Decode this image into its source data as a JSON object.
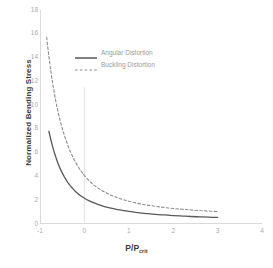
{
  "chart_data": {
    "type": "line",
    "title": "",
    "subtitle": "",
    "xlabel": "P/P",
    "xlabel_sub": "crit",
    "ylabel": "Normalized Bending  Stress",
    "xlim": [
      -1,
      4
    ],
    "ylim": [
      0,
      18
    ],
    "xticks": [
      "-1",
      "0",
      "1",
      "2",
      "3",
      "4"
    ],
    "xtick_values": [
      -1,
      0,
      1,
      2,
      3,
      4
    ],
    "yticks": [
      "0",
      "2",
      "4",
      "6",
      "8",
      "10",
      "12",
      "14",
      "16",
      "18"
    ],
    "ytick_values": [
      0,
      2,
      4,
      6,
      8,
      10,
      12,
      14,
      16,
      18
    ],
    "grid": false,
    "legend_position": "upper-center",
    "annotations": [
      {
        "name": "vertical-reference-line",
        "x": 0,
        "y_from": 0,
        "y_to": 11.5
      }
    ],
    "series": [
      {
        "name": "Angular Distortion",
        "style": "solid",
        "color": "#595959",
        "x": [
          -0.8,
          -0.75,
          -0.7,
          -0.65,
          -0.6,
          -0.55,
          -0.5,
          -0.45,
          -0.4,
          -0.35,
          -0.3,
          -0.25,
          -0.2,
          -0.15,
          -0.1,
          -0.05,
          0.0,
          0.1,
          0.2,
          0.3,
          0.4,
          0.5,
          0.6,
          0.7,
          0.8,
          0.9,
          1.0,
          1.2,
          1.4,
          1.6,
          1.8,
          2.0,
          2.2,
          2.4,
          2.6,
          2.8,
          3.0
        ],
        "y": [
          7.8,
          7.0,
          6.3,
          5.7,
          5.15,
          4.7,
          4.3,
          3.95,
          3.65,
          3.38,
          3.14,
          2.93,
          2.74,
          2.57,
          2.42,
          2.29,
          2.17,
          1.96,
          1.79,
          1.65,
          1.53,
          1.42,
          1.33,
          1.25,
          1.18,
          1.12,
          1.06,
          0.96,
          0.88,
          0.81,
          0.76,
          0.71,
          0.67,
          0.63,
          0.6,
          0.57,
          0.55
        ]
      },
      {
        "name": "Buckling Distortion",
        "style": "dashed",
        "color": "#8c8c8c",
        "x": [
          -0.85,
          -0.8,
          -0.75,
          -0.7,
          -0.65,
          -0.6,
          -0.55,
          -0.5,
          -0.45,
          -0.4,
          -0.35,
          -0.3,
          -0.25,
          -0.2,
          -0.15,
          -0.1,
          -0.05,
          0.0,
          0.1,
          0.2,
          0.3,
          0.4,
          0.5,
          0.6,
          0.7,
          0.8,
          0.9,
          1.0,
          1.2,
          1.4,
          1.6,
          1.8,
          2.0,
          2.2,
          2.4,
          2.6,
          2.8,
          3.0
        ],
        "y": [
          15.7,
          14.1,
          12.7,
          11.5,
          10.45,
          9.55,
          8.75,
          8.05,
          7.45,
          6.9,
          6.4,
          5.96,
          5.56,
          5.2,
          4.88,
          4.58,
          4.32,
          4.07,
          3.66,
          3.32,
          3.04,
          2.8,
          2.6,
          2.42,
          2.27,
          2.14,
          2.02,
          1.92,
          1.74,
          1.6,
          1.49,
          1.39,
          1.31,
          1.24,
          1.18,
          1.13,
          1.09,
          1.05
        ]
      }
    ]
  },
  "legend": {
    "items": [
      {
        "label": "Angular Distortion",
        "style": "solid",
        "color": "#595959"
      },
      {
        "label": "Buckling Distortion",
        "style": "dashed",
        "color": "#8c8c8c"
      }
    ]
  },
  "colors": {
    "solid_series": "#595959",
    "dashed_series": "#8c8c8c",
    "axis": "#d4d4d4",
    "tick_text": "#aaaaaa",
    "title_text": "#3d3d3d",
    "reference_line": "#e2e2e2",
    "background": "#ffffff"
  }
}
